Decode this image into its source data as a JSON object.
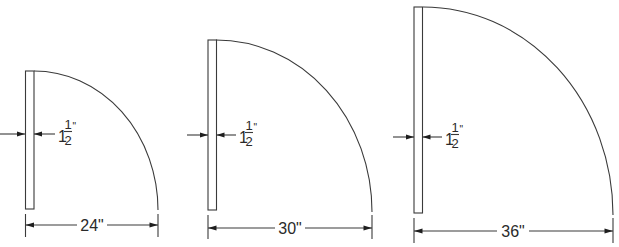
{
  "diagram": {
    "type": "door swing clearance drawings",
    "doors": [
      {
        "width_label": "24\"",
        "width_in": 24,
        "thickness": {
          "whole": "1",
          "numerator": "1",
          "denominator": "2",
          "unit": "\""
        }
      },
      {
        "width_label": "30\"",
        "width_in": 30,
        "thickness": {
          "whole": "1",
          "numerator": "1",
          "denominator": "2",
          "unit": "\""
        }
      },
      {
        "width_label": "36\"",
        "width_in": 36,
        "thickness": {
          "whole": "1",
          "numerator": "1",
          "denominator": "2",
          "unit": "\""
        }
      }
    ],
    "line_color": "#3a3a3a",
    "background": "#ffffff"
  }
}
